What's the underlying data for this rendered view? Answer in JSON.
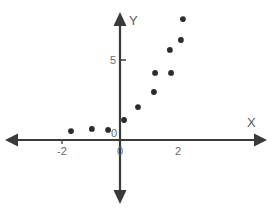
{
  "figure": {
    "background_color": "#ffffff",
    "axis_color": "#3a3a3a",
    "point_color": "#2b2b2b",
    "label_color": "#6a6a6a",
    "width": 275,
    "height": 214
  },
  "axes": {
    "x_axis_label": "X",
    "y_axis_label": "Y",
    "origin_label": "0",
    "x_tick_labels": [
      "-2",
      "0",
      "2"
    ],
    "y_tick_labels": [
      "5"
    ],
    "x_axis_pixel_y": 140,
    "y_axis_pixel_x": 120,
    "pixels_per_x_unit": 29,
    "pixels_per_y_unit": 16
  },
  "chart_data": {
    "type": "scatter",
    "title": "",
    "xlabel": "X",
    "ylabel": "Y",
    "xlim": [
      -2.7,
      3.2
    ],
    "ylim": [
      -4.5,
      8.6
    ],
    "grid": false,
    "legend": false,
    "xticks": [
      -2,
      0,
      2
    ],
    "yticks": [
      5
    ],
    "series": [
      {
        "name": "points",
        "marker": "circle",
        "color": "#2b2b2b",
        "points": [
          {
            "x": -1.69,
            "y": 0.56
          },
          {
            "x": -0.97,
            "y": 0.69
          },
          {
            "x": -0.41,
            "y": 0.63
          },
          {
            "x": 0.14,
            "y": 1.25
          },
          {
            "x": 0.62,
            "y": 2.06
          },
          {
            "x": 1.17,
            "y": 3.0
          },
          {
            "x": 1.21,
            "y": 4.19
          },
          {
            "x": 1.76,
            "y": 4.19
          },
          {
            "x": 1.72,
            "y": 5.63
          },
          {
            "x": 2.1,
            "y": 6.25
          },
          {
            "x": 2.17,
            "y": 7.56
          }
        ]
      }
    ]
  }
}
